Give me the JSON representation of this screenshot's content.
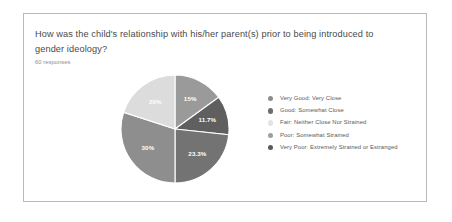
{
  "card": {
    "question": "How was the child's relationship with his/her parent(s) prior to being introduced to gender ideology?",
    "response_count": "60 responses"
  },
  "chart_data": {
    "type": "pie",
    "title": "How was the child's relationship with his/her parent(s) prior to being introduced to gender ideology?",
    "subtitle": "60 responses",
    "total_responses": 60,
    "legend_position": "right",
    "categories": [
      "Very Good: Very Close",
      "Good: Somewhat Close",
      "Fair: Neither Close Nor Strained",
      "Poor: Somewhat Strained",
      "Very Poor: Extremely Strained or Estranged"
    ],
    "values": [
      15,
      11.7,
      23.3,
      30,
      20
    ],
    "value_labels": [
      "15%",
      "11.7%",
      "23.3%",
      "30%",
      "20%"
    ],
    "colors": [
      "#9a9a9a",
      "#5f5f5f",
      "#e8e8e8",
      "#8e8e8e",
      "#7a7a7a"
    ],
    "slice_order": "clockwise from 12 o'clock",
    "slices": [
      {
        "label": "Very Good: Very Close",
        "percent": "15%",
        "value": 15,
        "color": "#9a9a9a"
      },
      {
        "label": "Good: Somewhat Close",
        "percent": "11.7%",
        "value": 11.7,
        "color": "#5f5f5f"
      },
      {
        "label": "Fair: Neither Close Nor Strained",
        "percent": "23.3%",
        "value": 23.3,
        "color": "#737373"
      },
      {
        "label": "Poor: Somewhat Strained",
        "percent": "30%",
        "value": 30,
        "color": "#8e8e8e"
      },
      {
        "label": "Very Poor: Extremely Strained or Estranged",
        "percent": "20%",
        "value": 20,
        "color": "#dcdcdc"
      }
    ]
  },
  "legend": {
    "items": [
      {
        "label": "Very Good: Very Close",
        "color": "#8d8d8d"
      },
      {
        "label": "Good: Somewhat Close",
        "color": "#6e6e6e"
      },
      {
        "label": "Fair: Neither Close Nor Strained",
        "color": "#e3e3e3"
      },
      {
        "label": "Poor: Somewhat Strained",
        "color": "#9e9e9e"
      },
      {
        "label": "Very Poor: Extremely Strained or Estranged",
        "color": "#5a5a5a"
      }
    ]
  }
}
